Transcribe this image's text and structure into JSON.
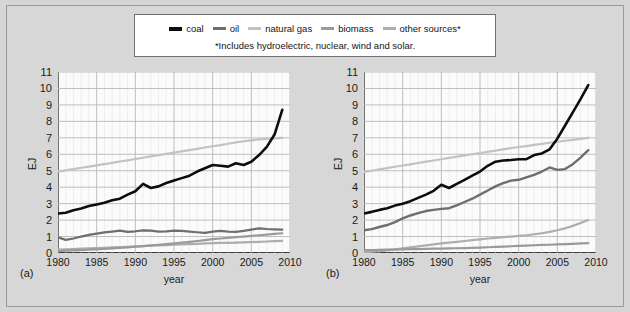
{
  "figure": {
    "note": "*Includes hydroelectric, nuclear, wind and solar."
  },
  "legend": {
    "items": [
      {
        "label": "coal",
        "color": "#0d0d0d",
        "name": "legend-coal"
      },
      {
        "label": "oil",
        "color": "#6e6e6e",
        "name": "legend-oil"
      },
      {
        "label": "natural gas",
        "color": "#c2c2c2",
        "name": "legend-natural-gas"
      },
      {
        "label": "biomass",
        "color": "#9a9a9a",
        "name": "legend-biomass"
      },
      {
        "label": "other sources*",
        "color": "#adadad",
        "name": "legend-other-sources"
      }
    ]
  },
  "panels": [
    {
      "tag": "(a)",
      "xlabel": "year",
      "ylabel": "EJ"
    },
    {
      "tag": "(b)",
      "xlabel": "year",
      "ylabel": "EJ"
    }
  ],
  "axes": {
    "ylabel": "EJ",
    "xlabel": "year",
    "yticks": [
      0,
      1,
      2,
      3,
      4,
      5,
      6,
      7,
      8,
      9,
      10,
      11
    ],
    "xticks": [
      1980,
      1985,
      1990,
      1995,
      2000,
      2005,
      2010
    ],
    "ylim": [
      0,
      11
    ],
    "xlim": [
      1980,
      2010
    ]
  },
  "chart_data": [
    {
      "type": "line",
      "panel": "(a)",
      "title": "",
      "xlabel": "year",
      "ylabel": "EJ",
      "xlim": [
        1980,
        2010
      ],
      "ylim": [
        0,
        11
      ],
      "grid": true,
      "legend_position": "top-outside",
      "x": [
        1980,
        1981,
        1982,
        1983,
        1984,
        1985,
        1986,
        1987,
        1988,
        1989,
        1990,
        1991,
        1992,
        1993,
        1994,
        1995,
        1996,
        1997,
        1998,
        1999,
        2000,
        2001,
        2002,
        2003,
        2004,
        2005,
        2006,
        2007,
        2008,
        2009
      ],
      "series": [
        {
          "name": "coal",
          "color": "#0d0d0d",
          "values": [
            2.4,
            2.45,
            2.6,
            2.7,
            2.85,
            2.95,
            3.05,
            3.2,
            3.3,
            3.55,
            3.75,
            4.2,
            3.95,
            4.05,
            4.25,
            4.4,
            4.55,
            4.7,
            4.95,
            5.15,
            5.35,
            5.3,
            5.25,
            5.45,
            5.35,
            5.55,
            5.95,
            6.45,
            7.2,
            8.7
          ],
          "linewidth": 2.6
        },
        {
          "name": "natural gas",
          "color": "#c2c2c2",
          "values": [
            4.95,
            5.02,
            5.1,
            5.18,
            5.25,
            5.33,
            5.4,
            5.48,
            5.56,
            5.63,
            5.71,
            5.79,
            5.87,
            5.94,
            6.02,
            6.1,
            6.18,
            6.25,
            6.33,
            6.41,
            6.49,
            6.56,
            6.64,
            6.72,
            6.79,
            6.85,
            6.9,
            6.94,
            6.97,
            7.0
          ],
          "linewidth": 2.2
        },
        {
          "name": "oil",
          "color": "#6e6e6e",
          "values": [
            0.95,
            0.8,
            0.88,
            1.0,
            1.1,
            1.18,
            1.25,
            1.3,
            1.36,
            1.28,
            1.32,
            1.38,
            1.36,
            1.3,
            1.32,
            1.36,
            1.34,
            1.3,
            1.26,
            1.22,
            1.3,
            1.34,
            1.3,
            1.28,
            1.34,
            1.42,
            1.5,
            1.46,
            1.44,
            1.42
          ],
          "linewidth": 2.2
        },
        {
          "name": "biomass",
          "color": "#9a9a9a",
          "values": [
            0.12,
            0.14,
            0.16,
            0.18,
            0.2,
            0.22,
            0.25,
            0.28,
            0.31,
            0.34,
            0.38,
            0.42,
            0.46,
            0.5,
            0.54,
            0.58,
            0.63,
            0.68,
            0.73,
            0.78,
            0.84,
            0.88,
            0.92,
            0.96,
            1.0,
            1.04,
            1.08,
            1.12,
            1.16,
            1.2
          ],
          "linewidth": 2.2
        },
        {
          "name": "other sources",
          "color": "#adadad",
          "values": [
            0.2,
            0.22,
            0.24,
            0.26,
            0.28,
            0.3,
            0.32,
            0.34,
            0.36,
            0.38,
            0.4,
            0.42,
            0.44,
            0.46,
            0.48,
            0.5,
            0.52,
            0.54,
            0.56,
            0.58,
            0.6,
            0.61,
            0.62,
            0.63,
            0.64,
            0.66,
            0.68,
            0.7,
            0.72,
            0.74
          ],
          "linewidth": 2.2
        }
      ]
    },
    {
      "type": "line",
      "panel": "(b)",
      "title": "",
      "xlabel": "year",
      "ylabel": "EJ",
      "xlim": [
        1980,
        2010
      ],
      "ylim": [
        0,
        11
      ],
      "grid": true,
      "legend_position": "top-outside",
      "x": [
        1980,
        1981,
        1982,
        1983,
        1984,
        1985,
        1986,
        1987,
        1988,
        1989,
        1990,
        1991,
        1992,
        1993,
        1994,
        1995,
        1996,
        1997,
        1998,
        1999,
        2000,
        2001,
        2002,
        2003,
        2004,
        2005,
        2006,
        2007,
        2008,
        2009
      ],
      "series": [
        {
          "name": "coal",
          "color": "#0d0d0d",
          "values": [
            2.4,
            2.5,
            2.62,
            2.72,
            2.88,
            3.0,
            3.15,
            3.35,
            3.55,
            3.78,
            4.15,
            3.95,
            4.2,
            4.45,
            4.7,
            4.95,
            5.3,
            5.55,
            5.62,
            5.65,
            5.7,
            5.7,
            5.95,
            6.05,
            6.3,
            6.95,
            7.75,
            8.55,
            9.35,
            10.2
          ],
          "linewidth": 2.6
        },
        {
          "name": "natural gas",
          "color": "#c2c2c2",
          "values": [
            4.92,
            5.0,
            5.08,
            5.16,
            5.24,
            5.32,
            5.39,
            5.47,
            5.55,
            5.62,
            5.7,
            5.78,
            5.85,
            5.93,
            6.0,
            6.08,
            6.15,
            6.22,
            6.3,
            6.37,
            6.44,
            6.5,
            6.57,
            6.63,
            6.7,
            6.76,
            6.82,
            6.88,
            6.94,
            7.0
          ],
          "linewidth": 2.2
        },
        {
          "name": "oil",
          "color": "#6e6e6e",
          "values": [
            1.38,
            1.45,
            1.58,
            1.7,
            1.88,
            2.1,
            2.28,
            2.42,
            2.55,
            2.62,
            2.68,
            2.72,
            2.9,
            3.1,
            3.3,
            3.55,
            3.8,
            4.05,
            4.25,
            4.4,
            4.45,
            4.6,
            4.75,
            4.95,
            5.2,
            5.05,
            5.1,
            5.4,
            5.8,
            6.25
          ],
          "linewidth": 2.4
        },
        {
          "name": "biomass",
          "color": "#9a9a9a",
          "values": [
            0.18,
            0.18,
            0.19,
            0.2,
            0.21,
            0.22,
            0.23,
            0.24,
            0.25,
            0.26,
            0.27,
            0.28,
            0.29,
            0.3,
            0.31,
            0.33,
            0.35,
            0.37,
            0.39,
            0.41,
            0.43,
            0.45,
            0.47,
            0.49,
            0.5,
            0.52,
            0.54,
            0.56,
            0.58,
            0.6
          ],
          "linewidth": 2.2
        },
        {
          "name": "other sources",
          "color": "#adadad",
          "values": [
            0.05,
            0.08,
            0.12,
            0.16,
            0.22,
            0.28,
            0.34,
            0.4,
            0.46,
            0.52,
            0.58,
            0.63,
            0.68,
            0.73,
            0.78,
            0.83,
            0.88,
            0.92,
            0.96,
            1.0,
            1.04,
            1.08,
            1.14,
            1.2,
            1.28,
            1.38,
            1.5,
            1.65,
            1.82,
            2.0
          ],
          "linewidth": 2.2
        }
      ]
    }
  ]
}
